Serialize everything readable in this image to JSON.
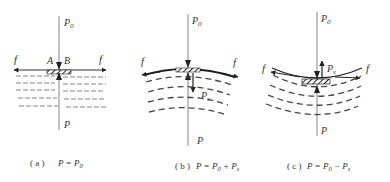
{
  "panels": [
    {
      "id": "a",
      "top_label": "P0",
      "bottom_label": "P",
      "left_force": "f",
      "right_force": "f",
      "point_a": "A",
      "point_b": "B",
      "caption_prefix": "( a )",
      "caption_eq": "P = P0",
      "shape": "flat"
    },
    {
      "id": "b",
      "top_label": "P0",
      "bottom_label": "P",
      "left_force": "f",
      "right_force": "f",
      "extra_force": "Ps",
      "caption_prefix": "( b )",
      "caption_eq": "P = P0 + Ps",
      "shape": "convex-up"
    },
    {
      "id": "c",
      "top_label": "P0",
      "bottom_label": "P",
      "left_force": "f",
      "right_force": "f",
      "extra_force": "Ps",
      "caption_prefix": "( c )",
      "caption_eq": "P = P0 − Ps",
      "shape": "concave-up"
    }
  ],
  "colors": {
    "line": "#444444",
    "thin": "#777777",
    "dash": "#555555",
    "background": "#ffffff"
  }
}
